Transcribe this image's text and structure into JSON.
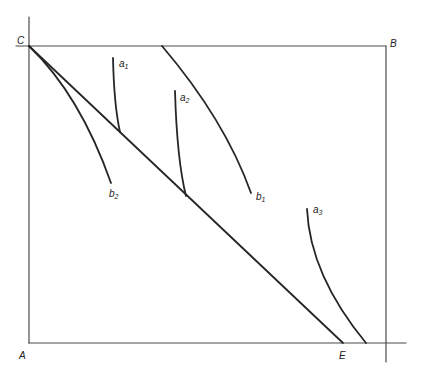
{
  "diagram": {
    "type": "box-diagram",
    "corners": {
      "C": {
        "label": "C",
        "x": 29,
        "y": 46
      },
      "B": {
        "label": "B",
        "x": 386,
        "y": 46
      },
      "A": {
        "label": "A",
        "x": 29,
        "y": 343
      },
      "E": {
        "label": "E",
        "x": 343,
        "y": 343
      }
    },
    "curves": [
      {
        "id": "a1",
        "label": "a",
        "sub": "1"
      },
      {
        "id": "a2",
        "label": "a",
        "sub": "2"
      },
      {
        "id": "a3",
        "label": "a",
        "sub": "3"
      },
      {
        "id": "b1",
        "label": "b",
        "sub": "1"
      },
      {
        "id": "b2",
        "label": "b",
        "sub": "2"
      }
    ],
    "diagonal": {
      "from": "C",
      "to": "E"
    }
  }
}
